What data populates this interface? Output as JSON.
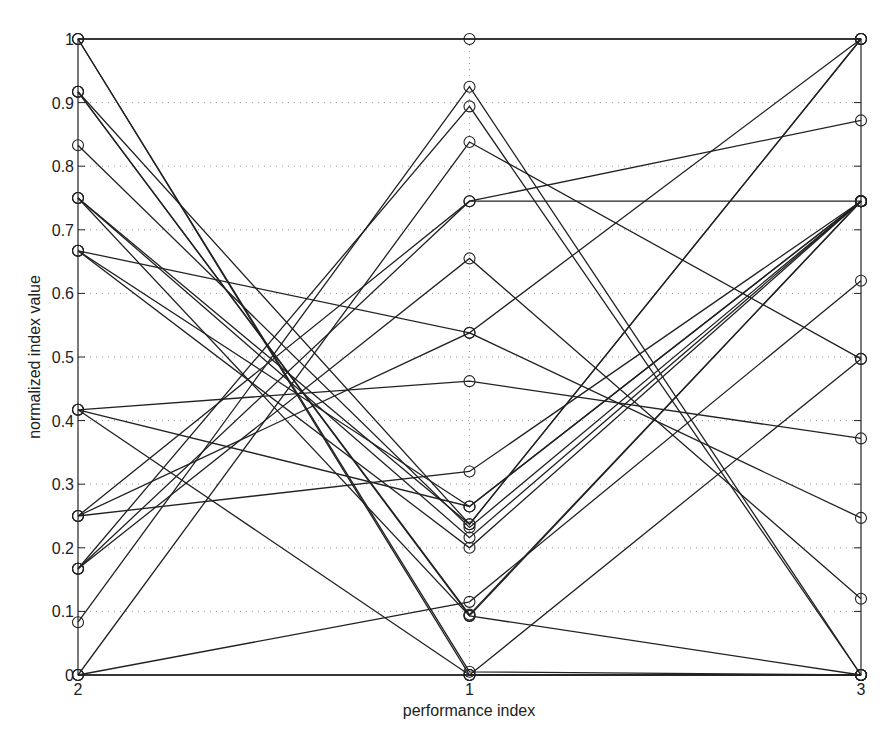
{
  "chart_data": {
    "type": "line",
    "subtype": "parallel-coordinates",
    "title": "",
    "xlabel": "performance index",
    "ylabel": "normalized index value",
    "x": [
      "2",
      "1",
      "3"
    ],
    "ylim": [
      0,
      1
    ],
    "yticks": [
      "0",
      "0.1",
      "0.2",
      "0.3",
      "0.4",
      "0.5",
      "0.6",
      "0.7",
      "0.8",
      "0.9",
      "1"
    ],
    "grid": "dotted horizontal + dotted vertical at middle axis",
    "marker": "open circle",
    "line_color": "#222222",
    "series": [
      {
        "name": "s1",
        "values": [
          1.0,
          1.0,
          1.0
        ]
      },
      {
        "name": "s2",
        "values": [
          1.0,
          0.0,
          0.0
        ]
      },
      {
        "name": "s3",
        "values": [
          1.0,
          0.005,
          0.0
        ]
      },
      {
        "name": "s4",
        "values": [
          0.917,
          0.093,
          0.745
        ]
      },
      {
        "name": "s5",
        "values": [
          0.917,
          0.095,
          0.745
        ]
      },
      {
        "name": "s6",
        "values": [
          0.917,
          0.237,
          1.0
        ]
      },
      {
        "name": "s7",
        "values": [
          0.833,
          0.232,
          0.745
        ]
      },
      {
        "name": "s8",
        "values": [
          0.75,
          0.237,
          1.0
        ]
      },
      {
        "name": "s9",
        "values": [
          0.75,
          0.216,
          0.745
        ]
      },
      {
        "name": "s10",
        "values": [
          0.667,
          0.265,
          0.745
        ]
      },
      {
        "name": "s11",
        "values": [
          0.667,
          0.2,
          0.745
        ]
      },
      {
        "name": "s12",
        "values": [
          0.417,
          0.462,
          0.372
        ]
      },
      {
        "name": "s13",
        "values": [
          0.417,
          0.265,
          0.745
        ]
      },
      {
        "name": "s14",
        "values": [
          0.25,
          0.538,
          0.247
        ]
      },
      {
        "name": "s15",
        "values": [
          0.25,
          0.32,
          0.745
        ]
      },
      {
        "name": "s16",
        "values": [
          0.167,
          0.745,
          0.745
        ]
      },
      {
        "name": "s17",
        "values": [
          0.167,
          0.894,
          0.0
        ]
      },
      {
        "name": "s18",
        "values": [
          0.083,
          0.925,
          0.0
        ]
      },
      {
        "name": "s19",
        "values": [
          0.0,
          0.838,
          0.497
        ]
      },
      {
        "name": "s20",
        "values": [
          0.25,
          0.745,
          0.872
        ]
      },
      {
        "name": "s21",
        "values": [
          0.167,
          0.655,
          0.12
        ]
      },
      {
        "name": "s22",
        "values": [
          0.0,
          0.115,
          0.62
        ]
      },
      {
        "name": "s23",
        "values": [
          0.0,
          0.0,
          0.0
        ]
      },
      {
        "name": "s24",
        "values": [
          0.417,
          0.0,
          0.497
        ]
      },
      {
        "name": "s25",
        "values": [
          0.667,
          0.538,
          1.0
        ]
      },
      {
        "name": "s26",
        "values": [
          0.75,
          0.093,
          0.0
        ]
      }
    ]
  },
  "layout": {
    "plot_left": 78,
    "plot_right": 861,
    "plot_top": 39,
    "plot_bottom": 675
  }
}
